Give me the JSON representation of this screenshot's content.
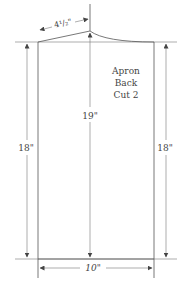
{
  "diagram": {
    "title_lines": [
      "Apron",
      "Back",
      "Cut 2"
    ],
    "dimensions": {
      "shoulder_width": "4¹/₂\"",
      "center_length": "19\"",
      "left_side_length": "18\"",
      "right_side_length": "18\"",
      "bottom_width": "10\""
    },
    "colors": {
      "line": "#555555",
      "text": "#444444",
      "background": "#ffffff"
    }
  }
}
